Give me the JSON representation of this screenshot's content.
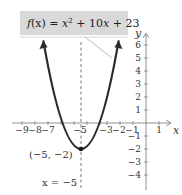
{
  "graph": {
    "function_label": "f(x) = x² + 10x + 23",
    "function_label_parts": {
      "f": "f",
      "arg": "(x)",
      "eq": " = ",
      "x": "x",
      "exp": "2",
      "rest": " + 10",
      "x2": "x",
      "tail": " + 23"
    },
    "x_axis_label": "x",
    "y_axis_label": "y",
    "x_ticks": [
      "−9",
      "−8",
      "−7",
      "−5",
      "−3",
      "−2",
      "−1",
      "1"
    ],
    "y_ticks_pos": [
      "6",
      "5",
      "4",
      "3",
      "2",
      "1"
    ],
    "y_ticks_neg": [
      "−1",
      "−2",
      "−3",
      "−4"
    ],
    "vertex_label": "(−5, −2)",
    "axis_of_symmetry_label": "x = −5"
  },
  "colors": {
    "curve": "#2b2b2b",
    "axis": "#666666",
    "label_box": "#d9d9d9"
  }
}
